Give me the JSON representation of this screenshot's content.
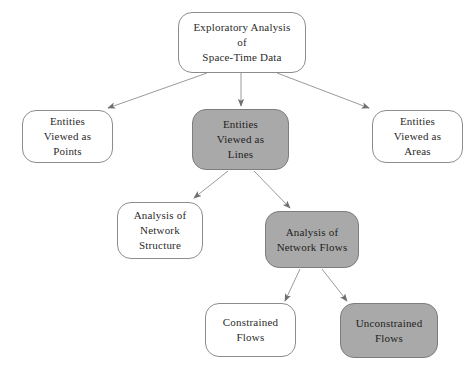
{
  "diagram": {
    "title": "Exploratory Analysis of Space-Time Data",
    "colors": {
      "background": "#ffffff",
      "node_fill_white": "#ffffff",
      "node_fill_gray": "#a9a9a9",
      "node_border": "#8c8c8c",
      "edge": "#8c8c8c",
      "text": "#2b2b2b"
    },
    "nodes": [
      {
        "id": "root",
        "name": "exploratory-analysis-node",
        "fill": "white",
        "lines": [
          "Exploratory Analysis",
          "of",
          "Space-Time Data"
        ]
      },
      {
        "id": "points",
        "name": "entities-viewed-as-points-node",
        "fill": "white",
        "lines": [
          "Entities",
          "Viewed as",
          "Points"
        ]
      },
      {
        "id": "lines",
        "name": "entities-viewed-as-lines-node",
        "fill": "gray",
        "lines": [
          "Entities",
          "Viewed as",
          "Lines"
        ]
      },
      {
        "id": "areas",
        "name": "entities-viewed-as-areas-node",
        "fill": "white",
        "lines": [
          "Entities",
          "Viewed as",
          "Areas"
        ]
      },
      {
        "id": "structure",
        "name": "analysis-of-network-structure-node",
        "fill": "white",
        "lines": [
          "Analysis of",
          "Network",
          "Structure"
        ]
      },
      {
        "id": "flows",
        "name": "analysis-of-network-flows-node",
        "fill": "gray",
        "lines": [
          "Analysis of",
          "Network Flows"
        ]
      },
      {
        "id": "constrained",
        "name": "constrained-flows-node",
        "fill": "white",
        "lines": [
          "Constrained",
          "Flows"
        ]
      },
      {
        "id": "unconstrained",
        "name": "unconstrained-flows-node",
        "fill": "gray",
        "lines": [
          "Unconstrained",
          "Flows"
        ]
      }
    ],
    "edges": [
      {
        "from": "root",
        "to": "points"
      },
      {
        "from": "root",
        "to": "lines"
      },
      {
        "from": "root",
        "to": "areas"
      },
      {
        "from": "lines",
        "to": "structure"
      },
      {
        "from": "lines",
        "to": "flows"
      },
      {
        "from": "flows",
        "to": "constrained"
      },
      {
        "from": "flows",
        "to": "unconstrained"
      }
    ]
  }
}
